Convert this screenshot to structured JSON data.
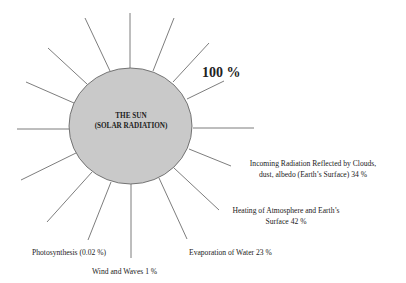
{
  "diagram": {
    "sun": {
      "title_line1": "THE SUN",
      "title_line2": "(SOLAR RADIATION)",
      "fill_color": "#c9c9c9"
    },
    "total_label": "100 %",
    "labels": {
      "reflected_line1": "Incoming Radiation Reflected by Clouds,",
      "reflected_line2": "dust, albedo (Earth’s Surface) 34 %",
      "heating_line1": "Heating of Atmosphere and Earth’s",
      "heating_line2": "Surface 42 %",
      "evaporation": "Evaporation of Water 23 %",
      "photosynthesis": "Photosynthesis (0.02 %)",
      "wind": "Wind and Waves 1 %"
    },
    "flows": [
      {
        "name": "Incoming Radiation Reflected by Clouds, dust, albedo (Earth's Surface)",
        "percent": 34
      },
      {
        "name": "Heating of Atmosphere and Earth's Surface",
        "percent": 42
      },
      {
        "name": "Evaporation of Water",
        "percent": 23
      },
      {
        "name": "Wind and Waves",
        "percent": 1
      },
      {
        "name": "Photosynthesis",
        "percent": 0.02
      }
    ]
  }
}
